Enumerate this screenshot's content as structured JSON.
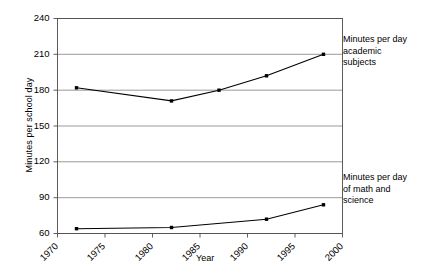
{
  "chart_data": {
    "type": "line",
    "title": "",
    "xlabel": "Year",
    "ylabel": "Minutes per school day",
    "xlim": [
      1970,
      2000
    ],
    "ylim": [
      60,
      240
    ],
    "grid": true,
    "legend_position": "right-inline-annotations",
    "x_ticks": [
      "1970",
      "1975",
      "1980",
      "1985",
      "1990",
      "1995",
      "2000"
    ],
    "x_tick_values": [
      1970,
      1975,
      1980,
      1985,
      1990,
      1995,
      2000
    ],
    "y_ticks": [
      "60",
      "90",
      "120",
      "150",
      "180",
      "210",
      "240"
    ],
    "y_tick_values": [
      60,
      90,
      120,
      150,
      180,
      210,
      240
    ],
    "series": [
      {
        "name": "Minutes per day academic subjects",
        "annotation": "Minutes per day\nacademic\nsubjects",
        "color": "#000000",
        "x": [
          1972,
          1982,
          1987,
          1992,
          1998
        ],
        "values": [
          182,
          171,
          180,
          192,
          210
        ]
      },
      {
        "name": "Minutes per day of math and science",
        "annotation": "Minutes per day\nof math and\nscience",
        "color": "#000000",
        "x": [
          1972,
          1982,
          1992,
          1998
        ],
        "values": [
          64,
          65,
          72,
          84
        ]
      }
    ]
  },
  "axes": {
    "y_title": "Minutes per school day",
    "x_title": "Year"
  },
  "annotations": {
    "top_series": "Minutes per day\nacademic\nsubjects",
    "bottom_series": "Minutes per day\nof math and\nscience"
  }
}
